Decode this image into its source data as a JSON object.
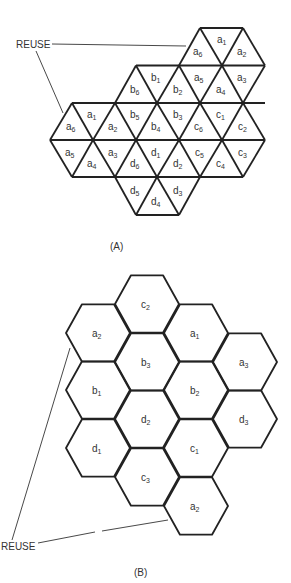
{
  "panel_a": {
    "caption": "(A)",
    "reuse_label": "REUSE",
    "description": "Triangular-cell reuse pattern with four clusters a, b, c, d of six triangles each plus a reuse cluster a",
    "triangles": [
      {
        "label": "a",
        "sub": "6",
        "cluster": "a-reuse"
      },
      {
        "label": "a",
        "sub": "1",
        "cluster": "a-reuse"
      },
      {
        "label": "a",
        "sub": "2",
        "cluster": "a-reuse"
      },
      {
        "label": "b",
        "sub": "6",
        "cluster": "b"
      },
      {
        "label": "b",
        "sub": "1",
        "cluster": "b"
      },
      {
        "label": "b",
        "sub": "2",
        "cluster": "b"
      },
      {
        "label": "a",
        "sub": "5",
        "cluster": "a-reuse"
      },
      {
        "label": "a",
        "sub": "4",
        "cluster": "a-reuse"
      },
      {
        "label": "a",
        "sub": "3",
        "cluster": "a-reuse"
      },
      {
        "label": "a",
        "sub": "6",
        "cluster": "a"
      },
      {
        "label": "a",
        "sub": "1",
        "cluster": "a"
      },
      {
        "label": "a",
        "sub": "2",
        "cluster": "a"
      },
      {
        "label": "b",
        "sub": "5",
        "cluster": "b"
      },
      {
        "label": "b",
        "sub": "4",
        "cluster": "b"
      },
      {
        "label": "b",
        "sub": "3",
        "cluster": "b"
      },
      {
        "label": "c",
        "sub": "6",
        "cluster": "c"
      },
      {
        "label": "c",
        "sub": "1",
        "cluster": "c"
      },
      {
        "label": "c",
        "sub": "2",
        "cluster": "c"
      },
      {
        "label": "a",
        "sub": "5",
        "cluster": "a"
      },
      {
        "label": "a",
        "sub": "4",
        "cluster": "a"
      },
      {
        "label": "a",
        "sub": "3",
        "cluster": "a"
      },
      {
        "label": "d",
        "sub": "6",
        "cluster": "d"
      },
      {
        "label": "d",
        "sub": "1",
        "cluster": "d"
      },
      {
        "label": "d",
        "sub": "2",
        "cluster": "d"
      },
      {
        "label": "c",
        "sub": "5",
        "cluster": "c"
      },
      {
        "label": "c",
        "sub": "4",
        "cluster": "c"
      },
      {
        "label": "c",
        "sub": "3",
        "cluster": "c"
      },
      {
        "label": "d",
        "sub": "5",
        "cluster": "d"
      },
      {
        "label": "d",
        "sub": "4",
        "cluster": "d"
      },
      {
        "label": "d",
        "sub": "3",
        "cluster": "d"
      }
    ]
  },
  "panel_b": {
    "caption": "(B)",
    "reuse_label": "REUSE",
    "description": "Hexagonal-cell reuse pattern with 3-cell clusters a, b, c, d and a reuse cell a3 / a2",
    "hexagons": [
      {
        "label": "c",
        "sub": "2"
      },
      {
        "label": "a",
        "sub": "2"
      },
      {
        "label": "a",
        "sub": "1"
      },
      {
        "label": "b",
        "sub": "3"
      },
      {
        "label": "a",
        "sub": "3"
      },
      {
        "label": "b",
        "sub": "1"
      },
      {
        "label": "b",
        "sub": "2"
      },
      {
        "label": "d",
        "sub": "2"
      },
      {
        "label": "d",
        "sub": "3"
      },
      {
        "label": "d",
        "sub": "1"
      },
      {
        "label": "c",
        "sub": "1"
      },
      {
        "label": "c",
        "sub": "3"
      },
      {
        "label": "a",
        "sub": "2"
      }
    ]
  },
  "colors": {
    "line": "#222222",
    "text": "#333333",
    "background": "#ffffff"
  }
}
